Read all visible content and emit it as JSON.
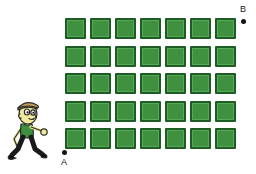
{
  "diagram": {
    "background_color": "#ffffff",
    "points": [
      {
        "id": "a",
        "label": "A",
        "role": "start-point",
        "x": 62,
        "y": 150
      },
      {
        "id": "b",
        "label": "B",
        "role": "end-point",
        "x": 241,
        "y": 19
      }
    ],
    "grid": {
      "rows": 5,
      "columns": 7,
      "tile_count": 35,
      "tile_size_px": 21,
      "column_pitch_px": 25,
      "row_pitch_px": 27.5,
      "tile_fill_color": "#3f9140",
      "tile_border_color": "#1d5c22",
      "tile_inner_highlight_color": "#58a85a",
      "tile_shape": "square",
      "tile_label": "green square tile"
    },
    "figure": {
      "name": "walking boy",
      "description": "cartoon boy in cap walking to the right",
      "cap_color": "#b08c4f",
      "skin_color": "#f0ea9a",
      "shirt_color": "#3f9140",
      "pants_color": "#1a1a1a",
      "shoes_color": "#111111",
      "outline_color": "#2a2a2a"
    }
  }
}
